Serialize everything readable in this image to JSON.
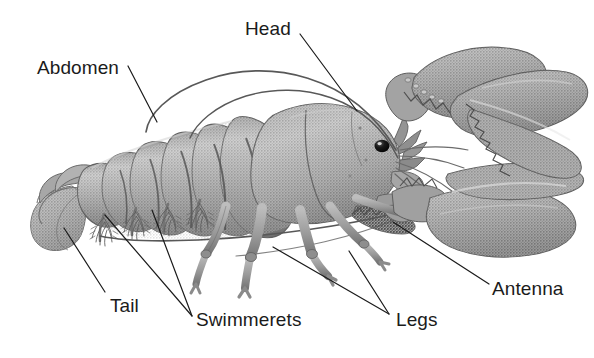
{
  "figure": {
    "style": "grayscale-halftone-illustration",
    "background_color": "#ffffff",
    "ink_color": "#1b1b1b",
    "body_gray_light": "#b9b9b9",
    "body_gray_mid": "#8e8e8e",
    "body_gray_dark": "#6a6a6a",
    "body_gray_shadow": "#4f4f4f"
  },
  "labels": [
    {
      "id": "head",
      "text": "Head",
      "x": 245,
      "y": 19
    },
    {
      "id": "abdomen",
      "text": "Abdomen",
      "x": 37,
      "y": 58
    },
    {
      "id": "tail",
      "text": "Tail",
      "x": 110,
      "y": 296
    },
    {
      "id": "swimmerets",
      "text": "Swimmerets",
      "x": 196,
      "y": 310
    },
    {
      "id": "legs",
      "text": "Legs",
      "x": 396,
      "y": 310
    },
    {
      "id": "antenna",
      "text": "Antenna",
      "x": 492,
      "y": 279
    }
  ],
  "leader_lines": [
    {
      "id": "head-leader",
      "x1": 300,
      "y1": 34,
      "x2": 357,
      "y2": 111
    },
    {
      "id": "abdomen-leader",
      "x1": 128,
      "y1": 66,
      "x2": 157,
      "y2": 122
    },
    {
      "id": "tail-leader",
      "x1": 105,
      "y1": 292,
      "x2": 64,
      "y2": 228
    },
    {
      "id": "swimmerets-leader-1",
      "x1": 192,
      "y1": 316,
      "x2": 105,
      "y2": 215
    },
    {
      "id": "swimmerets-leader-2",
      "x1": 192,
      "y1": 316,
      "x2": 152,
      "y2": 210
    },
    {
      "id": "legs-leader-1",
      "x1": 389,
      "y1": 314,
      "x2": 273,
      "y2": 247
    },
    {
      "id": "legs-leader-2",
      "x1": 389,
      "y1": 314,
      "x2": 349,
      "y2": 251
    },
    {
      "id": "antenna-leader",
      "x1": 489,
      "y1": 284,
      "x2": 393,
      "y2": 222
    }
  ],
  "anatomy_parts": [
    "head-carapace",
    "abdomen-segments",
    "tail-fan",
    "swimmerets",
    "walking-legs",
    "antennae",
    "claw-upper",
    "claw-lower",
    "eye"
  ]
}
